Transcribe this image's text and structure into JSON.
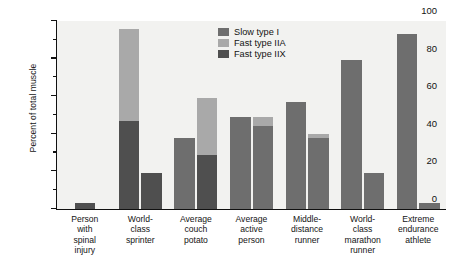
{
  "chart_data": {
    "type": "bar",
    "title": "",
    "subtitle": "",
    "xlabel": "",
    "ylabel": "Percent of total muscle",
    "ylim": [
      0,
      100
    ],
    "ytick_labels": [
      "0",
      "20",
      "40",
      "60",
      "80",
      "100"
    ],
    "ytick_values": [
      0,
      20,
      40,
      60,
      80,
      100
    ],
    "minor_tick_values": [
      10,
      30,
      50,
      70,
      90
    ],
    "grid": false,
    "legend_position": "top-right",
    "stacked": true,
    "categories": [
      "Person\nwith\nspinal\ninjury",
      "World-\nclass\nsprinter",
      "Average\ncouch\npotato",
      "Average\nactive\nperson",
      "Middle-\ndistance\nrunner",
      "World-\nclass\nmarathon\nrunner",
      "Extreme\nendurance\nathlete"
    ],
    "series": [
      {
        "name": "Slow type I",
        "color": "#6e6e6e",
        "values": [
          0,
          0,
          38,
          49,
          57,
          79,
          93
        ]
      },
      {
        "name": "Fast type IIA",
        "color": "#a9a9a9",
        "values": [
          0,
          49,
          0,
          5,
          2,
          0,
          0
        ]
      },
      {
        "name": "Fast type IIX",
        "color": "#4f4f4f",
        "values": [
          3,
          47,
          0,
          0,
          0,
          0,
          0
        ]
      }
    ],
    "bars": [
      {
        "category": "Person with spinal injury",
        "columns": [
          {
            "segments": [
              {
                "series": "Fast type IIX",
                "value": 3
              }
            ],
            "total": 3
          }
        ]
      },
      {
        "category": "World-class sprinter",
        "columns": [
          {
            "segments": [
              {
                "series": "Fast type IIX",
                "value": 47
              },
              {
                "series": "Fast type IIA",
                "value": 49
              }
            ],
            "total": 96
          },
          {
            "segments": [
              {
                "series": "Fast type IIX",
                "value": 19
              }
            ],
            "total": 19
          }
        ]
      },
      {
        "category": "Average couch potato",
        "columns": [
          {
            "segments": [
              {
                "series": "Slow type I",
                "value": 38
              }
            ],
            "total": 38
          },
          {
            "segments": [
              {
                "series": "Fast type IIX",
                "value": 29
              },
              {
                "series": "Fast type IIA",
                "value": 30
              }
            ],
            "total": 59
          }
        ]
      },
      {
        "category": "Average active person",
        "columns": [
          {
            "segments": [
              {
                "series": "Slow type I",
                "value": 49
              }
            ],
            "total": 49
          },
          {
            "segments": [
              {
                "series": "Slow type I",
                "value": 44
              },
              {
                "series": "Fast type IIA",
                "value": 5
              }
            ],
            "total": 49
          }
        ]
      },
      {
        "category": "Middle-distance runner",
        "columns": [
          {
            "segments": [
              {
                "series": "Slow type I",
                "value": 57
              }
            ],
            "total": 57
          },
          {
            "segments": [
              {
                "series": "Slow type I",
                "value": 38
              },
              {
                "series": "Fast type IIA",
                "value": 2
              }
            ],
            "total": 40
          }
        ]
      },
      {
        "category": "World-class marathon runner",
        "columns": [
          {
            "segments": [
              {
                "series": "Slow type I",
                "value": 79
              }
            ],
            "total": 79
          },
          {
            "segments": [
              {
                "series": "Slow type I",
                "value": 19
              }
            ],
            "total": 19
          }
        ]
      },
      {
        "category": "Extreme endurance athlete",
        "columns": [
          {
            "segments": [
              {
                "series": "Slow type I",
                "value": 93
              }
            ],
            "total": 93
          },
          {
            "segments": [
              {
                "series": "Slow type I",
                "value": 3
              }
            ],
            "total": 3
          }
        ]
      }
    ]
  },
  "legend": {
    "items": [
      {
        "label": "Slow type I",
        "color": "#6e6e6e"
      },
      {
        "label": "Fast type IIA",
        "color": "#a9a9a9"
      },
      {
        "label": "Fast type IIX",
        "color": "#4f4f4f"
      }
    ]
  },
  "axis": {
    "y_title": "Percent of total muscle"
  }
}
